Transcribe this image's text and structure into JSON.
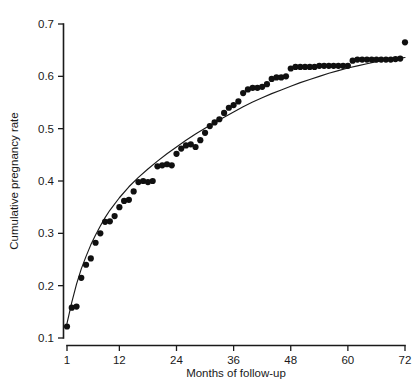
{
  "chart_data": {
    "type": "scatter",
    "title": "",
    "xlabel": "Months of follow-up",
    "ylabel": "Cumulative pregnancy rate",
    "xlim": [
      1,
      72
    ],
    "ylim": [
      0.1,
      0.7
    ],
    "xticks": [
      1,
      12,
      24,
      36,
      48,
      60,
      72
    ],
    "xticklabels": [
      "1",
      "12",
      "24",
      "36",
      "48",
      "60",
      "72"
    ],
    "yticks": [
      0.1,
      0.2,
      0.3,
      0.4,
      0.5,
      0.6,
      0.7
    ],
    "yticklabels": [
      "0.1",
      "0.2",
      "0.3",
      "0.4",
      "0.5",
      "0.6",
      "0.7"
    ],
    "grid": false,
    "legend": null,
    "marker_color": "#101010",
    "curve_color": "#1a1a1a",
    "marker_style": "filled-circle",
    "series": [
      {
        "name": "Observed cumulative pregnancy rate",
        "points": [
          [
            1,
            0.122
          ],
          [
            2,
            0.158
          ],
          [
            3,
            0.16
          ],
          [
            4,
            0.215
          ],
          [
            5,
            0.24
          ],
          [
            6,
            0.252
          ],
          [
            7,
            0.282
          ],
          [
            8,
            0.3
          ],
          [
            9,
            0.322
          ],
          [
            10,
            0.323
          ],
          [
            11,
            0.333
          ],
          [
            12,
            0.35
          ],
          [
            13,
            0.362
          ],
          [
            14,
            0.364
          ],
          [
            15,
            0.38
          ],
          [
            16,
            0.398
          ],
          [
            17,
            0.4
          ],
          [
            18,
            0.398
          ],
          [
            19,
            0.4
          ],
          [
            20,
            0.428
          ],
          [
            21,
            0.43
          ],
          [
            22,
            0.432
          ],
          [
            23,
            0.43
          ],
          [
            24,
            0.452
          ],
          [
            25,
            0.462
          ],
          [
            26,
            0.468
          ],
          [
            27,
            0.47
          ],
          [
            28,
            0.465
          ],
          [
            29,
            0.478
          ],
          [
            30,
            0.492
          ],
          [
            31,
            0.505
          ],
          [
            32,
            0.512
          ],
          [
            33,
            0.518
          ],
          [
            34,
            0.53
          ],
          [
            35,
            0.54
          ],
          [
            36,
            0.545
          ],
          [
            37,
            0.552
          ],
          [
            38,
            0.568
          ],
          [
            39,
            0.575
          ],
          [
            40,
            0.578
          ],
          [
            41,
            0.578
          ],
          [
            42,
            0.58
          ],
          [
            43,
            0.585
          ],
          [
            44,
            0.595
          ],
          [
            45,
            0.598
          ],
          [
            46,
            0.598
          ],
          [
            47,
            0.6
          ],
          [
            48,
            0.615
          ],
          [
            49,
            0.618
          ],
          [
            50,
            0.618
          ],
          [
            51,
            0.618
          ],
          [
            52,
            0.618
          ],
          [
            53,
            0.618
          ],
          [
            54,
            0.62
          ],
          [
            55,
            0.62
          ],
          [
            56,
            0.62
          ],
          [
            57,
            0.62
          ],
          [
            58,
            0.62
          ],
          [
            59,
            0.62
          ],
          [
            60,
            0.62
          ],
          [
            61,
            0.63
          ],
          [
            62,
            0.632
          ],
          [
            63,
            0.632
          ],
          [
            64,
            0.632
          ],
          [
            65,
            0.632
          ],
          [
            66,
            0.632
          ],
          [
            67,
            0.632
          ],
          [
            68,
            0.632
          ],
          [
            69,
            0.632
          ],
          [
            70,
            0.633
          ],
          [
            71,
            0.634
          ],
          [
            72,
            0.665
          ]
        ]
      }
    ],
    "fitted_curve": {
      "name": "Fitted model curve",
      "points": [
        [
          1,
          0.128
        ],
        [
          2,
          0.168
        ],
        [
          3,
          0.203
        ],
        [
          4,
          0.232
        ],
        [
          5,
          0.256
        ],
        [
          6,
          0.278
        ],
        [
          7,
          0.297
        ],
        [
          8,
          0.314
        ],
        [
          9,
          0.33
        ],
        [
          10,
          0.344
        ],
        [
          12,
          0.368
        ],
        [
          14,
          0.389
        ],
        [
          16,
          0.407
        ],
        [
          18,
          0.423
        ],
        [
          20,
          0.438
        ],
        [
          22,
          0.452
        ],
        [
          24,
          0.465
        ],
        [
          26,
          0.478
        ],
        [
          28,
          0.49
        ],
        [
          30,
          0.501
        ],
        [
          32,
          0.512
        ],
        [
          34,
          0.522
        ],
        [
          36,
          0.532
        ],
        [
          38,
          0.542
        ],
        [
          40,
          0.551
        ],
        [
          42,
          0.559
        ],
        [
          44,
          0.567
        ],
        [
          46,
          0.574
        ],
        [
          48,
          0.581
        ],
        [
          50,
          0.588
        ],
        [
          52,
          0.594
        ],
        [
          54,
          0.6
        ],
        [
          56,
          0.606
        ],
        [
          58,
          0.611
        ],
        [
          60,
          0.616
        ],
        [
          62,
          0.62
        ],
        [
          64,
          0.624
        ],
        [
          66,
          0.628
        ],
        [
          68,
          0.631
        ],
        [
          70,
          0.634
        ],
        [
          72,
          0.636
        ]
      ]
    }
  }
}
